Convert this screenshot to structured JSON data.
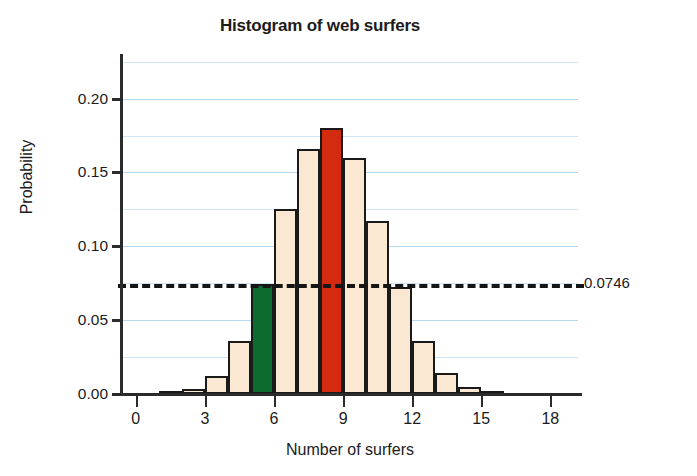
{
  "chart_data": {
    "type": "bar",
    "title": "Histogram of web surfers",
    "xlabel": "Number of surfers",
    "ylabel": "Probability",
    "categories": [
      0,
      1,
      2,
      3,
      4,
      5,
      6,
      7,
      8,
      9,
      10,
      11,
      12,
      13,
      14,
      15,
      16,
      17,
      18
    ],
    "values": [
      0.0,
      0.001,
      0.0035,
      0.0125,
      0.036,
      0.0746,
      0.125,
      0.166,
      0.18,
      0.16,
      0.117,
      0.0725,
      0.036,
      0.0145,
      0.005,
      0.0015,
      0.0,
      0.0,
      0.0
    ],
    "xlim": [
      -0.6,
      19.2
    ],
    "ylim": [
      0.0,
      0.2275
    ],
    "xticks": [
      0,
      3,
      6,
      9,
      12,
      15,
      18
    ],
    "xtick_labels": [
      "0",
      "3",
      "6",
      "9",
      "12",
      "15",
      "18"
    ],
    "yticks": [
      0.0,
      0.05,
      0.1,
      0.15,
      0.2
    ],
    "ytick_labels": [
      "0.00",
      "0.05",
      "0.10",
      "0.15",
      "0.20"
    ],
    "minor_gridlines": [
      0.025,
      0.075,
      0.125,
      0.175,
      0.225
    ],
    "grid": true,
    "grid_color": "#b6d8ef",
    "legend": null,
    "bar_colors": {
      "default": "#fae8d2",
      "highlight_green": "#0c6b2e",
      "highlight_red": "#d42b10",
      "edge": "#1a1a1a"
    },
    "highlighted_bars": [
      {
        "category": 5,
        "color_role": "highlight_green"
      },
      {
        "category": 8,
        "color_role": "highlight_red"
      }
    ],
    "annotations": [
      {
        "type": "hline",
        "label": "0.0746",
        "value": 0.0746,
        "style": "dashed",
        "color": "#151515"
      }
    ]
  },
  "axis": {
    "y_title": "Probability",
    "x_title": "Number of surfers"
  }
}
